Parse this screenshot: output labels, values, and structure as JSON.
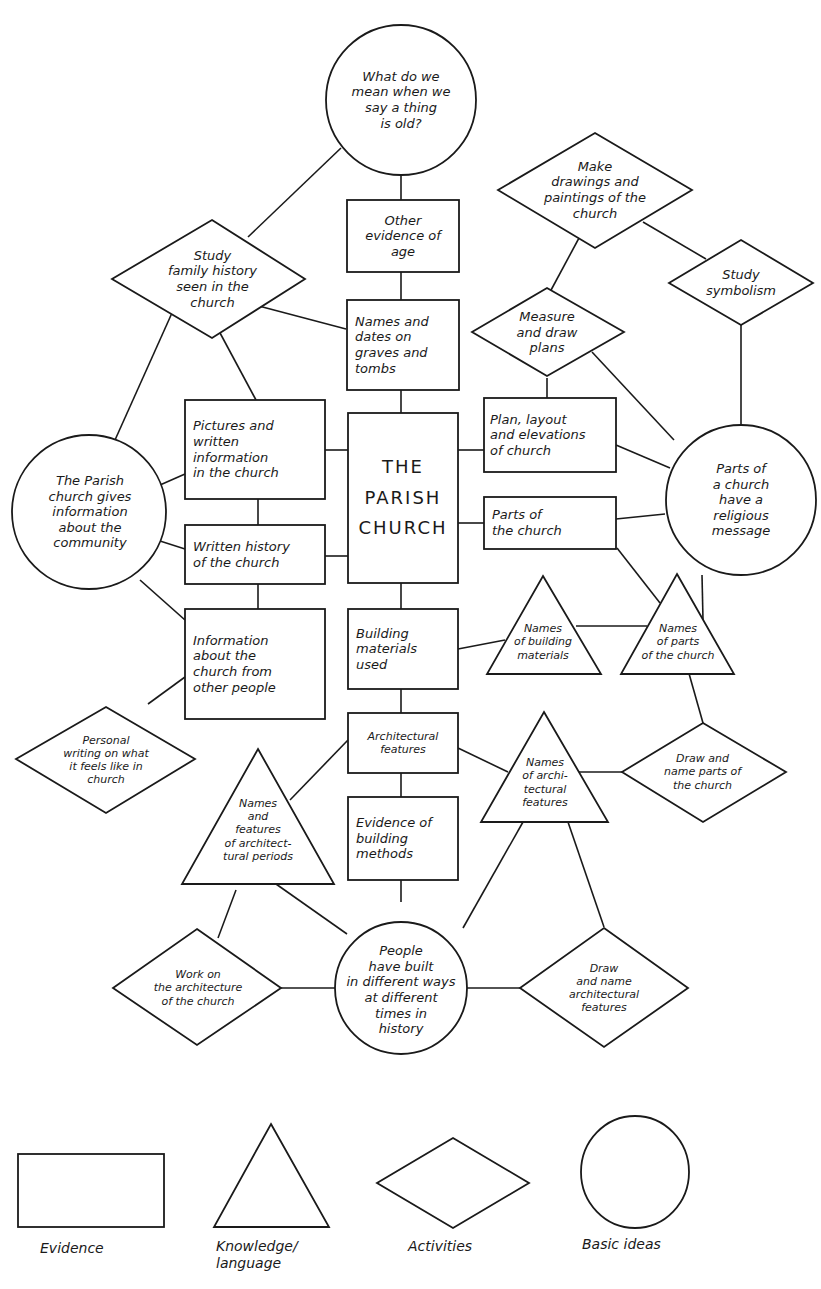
{
  "diagram": {
    "center": {
      "label": "THE\nPARISH\nCHURCH"
    },
    "nodes": {
      "what_old": "What do we\nmean when we\nsay a thing\nis old?",
      "other_evidence": "Other\nevidence of\nage",
      "names_dates": "Names and\ndates on\ngraves and\ntombs",
      "study_family": "Study\nfamily history\nseen in the\nchurch",
      "make_drawings": "Make\ndrawings and\npaintings of the\nchurch",
      "study_symbolism": "Study\nsymbolism",
      "measure_plans": "Measure\nand draw\nplans",
      "pictures_written": "Pictures and\nwritten\ninformation\nin the church",
      "parish_gives_info": "The Parish\nchurch gives\ninformation\nabout the\ncommunity",
      "plan_layout": "Plan, layout\nand elevations\nof church",
      "parts_religious": "Parts of\na church\nhave a\nreligious\nmessage",
      "written_history": "Written history\nof the church",
      "parts_church": "Parts of\nthe church",
      "info_other_people": "Information\nabout the\nchurch from\nother people",
      "building_materials": "Building\nmaterials\nused",
      "names_building_materials": "Names\nof building\nmaterials",
      "names_parts": "Names\nof parts\nof the church",
      "personal_writing": "Personal\nwriting on what\nit feels like in\nchurch",
      "architectural_features": "Architectural\nfeatures",
      "names_arch_features": "Names\nof archi-\ntectural\nfeatures",
      "draw_name_parts": "Draw and\nname parts of\nthe church",
      "names_periods": "Names\nand\nfeatures\nof architect-\ntural periods",
      "evidence_methods": "Evidence of\nbuilding\nmethods",
      "people_built": "People\nhave built\nin different ways\nat different\ntimes in\nhistory",
      "work_architecture": "Work on\nthe architecture\nof the church",
      "draw_name_arch": "Draw\nand name\narchitectural\nfeatures"
    }
  },
  "legend": {
    "items": [
      {
        "shape": "rectangle",
        "label": "Evidence"
      },
      {
        "shape": "triangle",
        "label": "Knowledge/\nlanguage"
      },
      {
        "shape": "diamond",
        "label": "Activities"
      },
      {
        "shape": "circle",
        "label": "Basic ideas"
      }
    ]
  }
}
